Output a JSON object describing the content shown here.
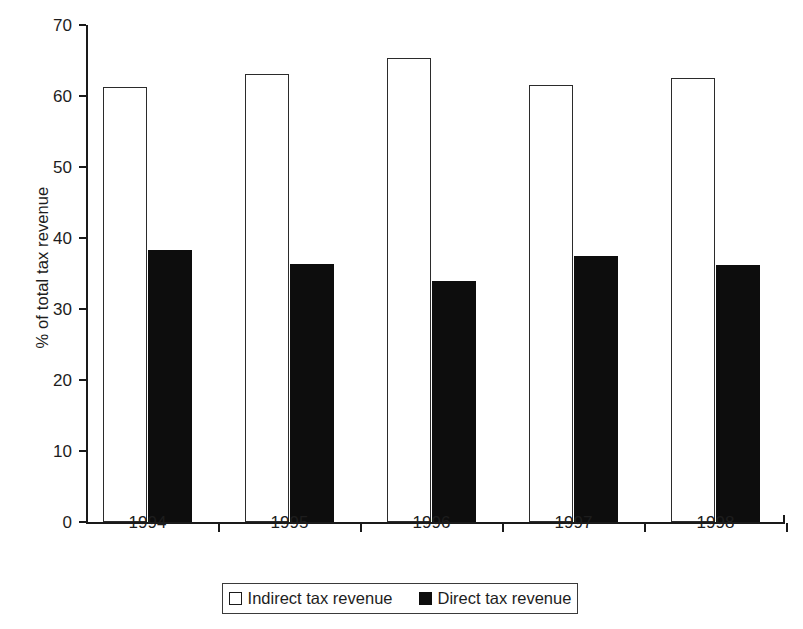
{
  "chart_data": {
    "type": "bar",
    "title": "",
    "subtitle": "",
    "xlabel": "",
    "ylabel": "% of total tax revenue",
    "categories": [
      "1994",
      "1995",
      "1996",
      "1997",
      "1998"
    ],
    "series": [
      {
        "name": "Indirect tax revenue",
        "color": "#ffffff",
        "edge_color": "#1a1a1a",
        "values": [
          61.3,
          63.1,
          65.4,
          61.5,
          62.6
        ]
      },
      {
        "name": "Direct tax revenue",
        "color": "#0d0d0d",
        "edge_color": "#0d0d0d",
        "values": [
          38.3,
          36.4,
          34.0,
          37.5,
          36.2
        ]
      }
    ],
    "ylim": [
      0,
      70
    ],
    "yticks": [
      0,
      10,
      20,
      30,
      40,
      50,
      60,
      70
    ],
    "ytick_labels": [
      "0",
      "10",
      "20",
      "30",
      "40",
      "50",
      "60",
      "70"
    ],
    "grid": false,
    "legend_position": "bottom",
    "legend_border": true,
    "background": "#ffffff"
  },
  "legend": {
    "items": [
      {
        "label": "Indirect tax revenue",
        "swatch": "white-square"
      },
      {
        "label": "Direct tax revenue",
        "swatch": "black-square"
      }
    ]
  }
}
